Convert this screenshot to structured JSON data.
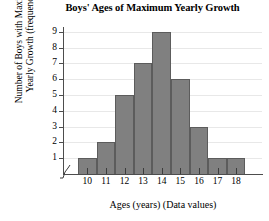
{
  "chart_data": {
    "type": "bar",
    "title": "Boys' Ages of Maximum Yearly Growth",
    "xlabel": "Ages (years) (Data values)",
    "ylabel_line1": "Number of Boys with Maximum",
    "ylabel_line2": "Yearly Growth (frequency)",
    "categories": [
      "10",
      "11",
      "12",
      "13",
      "14",
      "15",
      "16",
      "17",
      "18"
    ],
    "values": [
      1,
      2,
      5,
      7,
      9,
      6,
      3,
      1,
      1
    ],
    "ylim": [
      0,
      9
    ],
    "ytick_labels": [
      "1",
      "2",
      "3",
      "4",
      "5",
      "6",
      "7",
      "8",
      "9"
    ],
    "ytick_values": [
      1,
      2,
      3,
      4,
      5,
      6,
      7,
      8,
      9
    ],
    "grid": true,
    "legend": "none",
    "axis_break": "x-axis break at origin",
    "bar_color": "#808080",
    "bar_edge_color": "#5c5c5c",
    "gridline_color": "#e8e8e8",
    "axis_color": "#4d4d4d",
    "background": "#ffffff"
  }
}
